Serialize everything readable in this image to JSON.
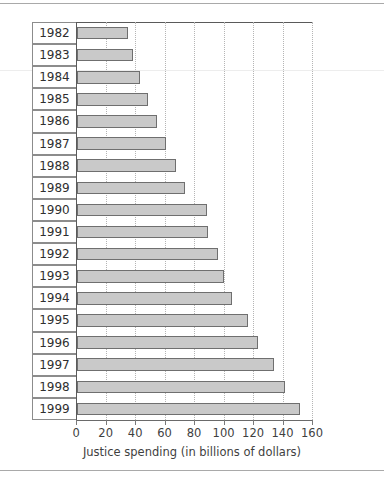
{
  "chart_data": {
    "type": "bar",
    "orientation": "horizontal",
    "title": "",
    "xlabel": "Justice spending (in billions of dollars)",
    "ylabel": "",
    "xlim": [
      0,
      160
    ],
    "xticks": [
      0,
      20,
      40,
      60,
      80,
      100,
      120,
      140,
      160
    ],
    "grid": "vertical-dotted",
    "legend": "none",
    "categories": [
      "1982",
      "1983",
      "1984",
      "1985",
      "1986",
      "1987",
      "1988",
      "1989",
      "1990",
      "1991",
      "1992",
      "1993",
      "1994",
      "1995",
      "1996",
      "1997",
      "1998",
      "1999"
    ],
    "values": [
      34.5,
      38,
      43,
      48.5,
      54,
      60.5,
      67,
      73,
      88,
      89,
      95.5,
      100,
      105,
      116,
      122.5,
      134,
      141,
      151
    ],
    "series": [
      {
        "name": "Justice spending",
        "values": [
          34.5,
          38,
          43,
          48.5,
          54,
          60.5,
          67,
          73,
          88,
          89,
          95.5,
          100,
          105,
          116,
          122.5,
          134,
          141,
          151
        ]
      }
    ],
    "bar_fill_color": "#c9c9c9",
    "bar_border_color": "#6f6f6f",
    "gridline_color": "#b5b5b5",
    "axis_color": "#5a5a5a"
  }
}
